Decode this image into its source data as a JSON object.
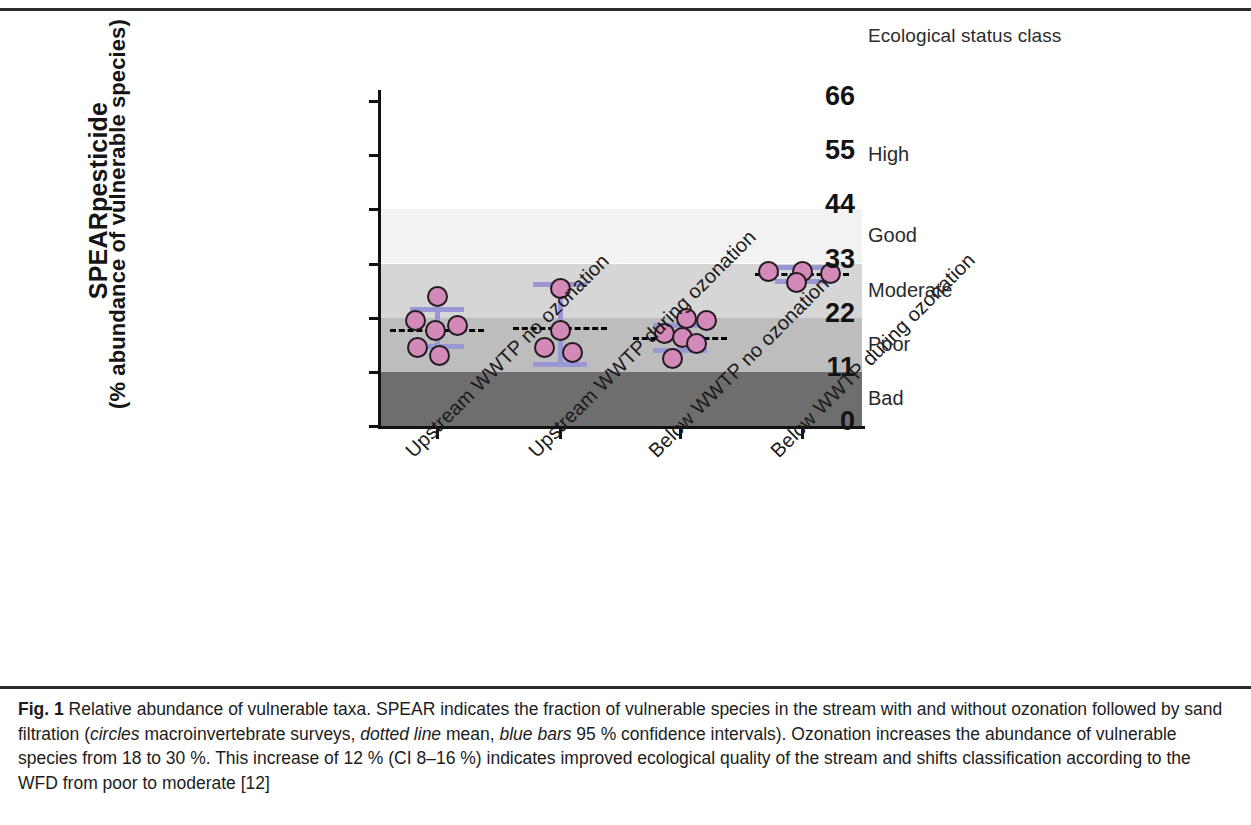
{
  "header": {
    "status_class_title": "Ecological status class"
  },
  "axes": {
    "y_title_line1": "SPEARpesticide",
    "y_title_line2": "(% abundance of vulnerable species)",
    "y_ticks": [
      "66",
      "55",
      "44",
      "33",
      "22",
      "11",
      "0"
    ],
    "x_labels": [
      "Upstream WWTP no ozonation",
      "Upstream WWTP during ozonation",
      "Below WWTP no ozonation",
      "Below WWTP during ozonation"
    ]
  },
  "status_classes": [
    {
      "label": "High",
      "min": 44,
      "max": 66
    },
    {
      "label": "Good",
      "min": 33,
      "max": 44
    },
    {
      "label": "Moderate",
      "min": 22,
      "max": 33
    },
    {
      "label": "Poor",
      "min": 11,
      "max": 22
    },
    {
      "label": "Bad",
      "min": 0,
      "max": 11
    }
  ],
  "caption": {
    "figure_number": "Fig. 1",
    "text_1": "Relative abundance of vulnerable taxa. SPEAR indicates the fraction of vulnerable species in the stream with and without ozonation followed by sand filtration (",
    "italic_1": "circles",
    "text_2": " macroinvertebrate surveys, ",
    "italic_2": "dotted line",
    "text_3": " mean, ",
    "italic_3": "blue bars",
    "text_4": " 95 % confidence intervals). Ozonation increases the abundance of vulnerable species from 18 to 30 %. This increase of 12 % (CI 8–16 %) indicates improved ecological quality of the stream and shifts classification according to the WFD from poor to moderate [12]"
  },
  "chart_data": {
    "type": "scatter",
    "title": "Relative abundance of vulnerable taxa",
    "xlabel": "",
    "ylabel": "SPEARpesticide (% abundance of vulnerable species)",
    "ylim": [
      0,
      66
    ],
    "y_ticks": [
      0,
      11,
      22,
      33,
      44,
      55,
      66
    ],
    "grid": false,
    "legend": "none",
    "categories": [
      "Upstream WWTP no ozonation",
      "Upstream WWTP during ozonation",
      "Below WWTP no ozonation",
      "Below WWTP during ozonation"
    ],
    "groups": [
      {
        "name": "Upstream WWTP no ozonation",
        "points": [
          26.5,
          21.5,
          20.5,
          19.5,
          16.0,
          14.5
        ],
        "mean": 19.8,
        "ci_low": 16.3,
        "ci_high": 23.8
      },
      {
        "name": "Upstream WWTP during ozonation",
        "points": [
          28.0,
          19.5,
          16.0,
          15.0
        ],
        "mean": 20.2,
        "ci_low": 12.5,
        "ci_high": 28.8
      },
      {
        "name": "Below WWTP no ozonation",
        "points": [
          22.0,
          21.5,
          18.8,
          18.0,
          16.8,
          13.8
        ],
        "mean": 18.0,
        "ci_low": 15.4,
        "ci_high": 20.6
      },
      {
        "name": "Below WWTP during ozonation",
        "points": [
          31.5,
          31.5,
          31.0,
          29.3
        ],
        "mean": 31.0,
        "ci_low": 29.5,
        "ci_high": 32.2
      }
    ],
    "bands": [
      {
        "label": "High",
        "range": [
          44,
          66
        ],
        "fill": "#ffffff"
      },
      {
        "label": "Good",
        "range": [
          33,
          44
        ],
        "fill": "#f2f2f2"
      },
      {
        "label": "Moderate",
        "range": [
          22,
          33
        ],
        "fill": "#d6d6d6"
      },
      {
        "label": "Poor",
        "range": [
          11,
          22
        ],
        "fill": "#bdbdbd"
      },
      {
        "label": "Bad",
        "range": [
          0,
          11
        ],
        "fill": "#6e6e6e"
      }
    ],
    "annotations": {
      "mean_without_ozonation": 18,
      "mean_with_ozonation": 30,
      "increase": 12,
      "increase_ci": [
        8,
        16
      ]
    }
  },
  "colors": {
    "dot_fill": "#d48ab8",
    "dot_stroke": "#241b22",
    "ci_bar": "#9a97d6",
    "mean_line": "#000000"
  }
}
